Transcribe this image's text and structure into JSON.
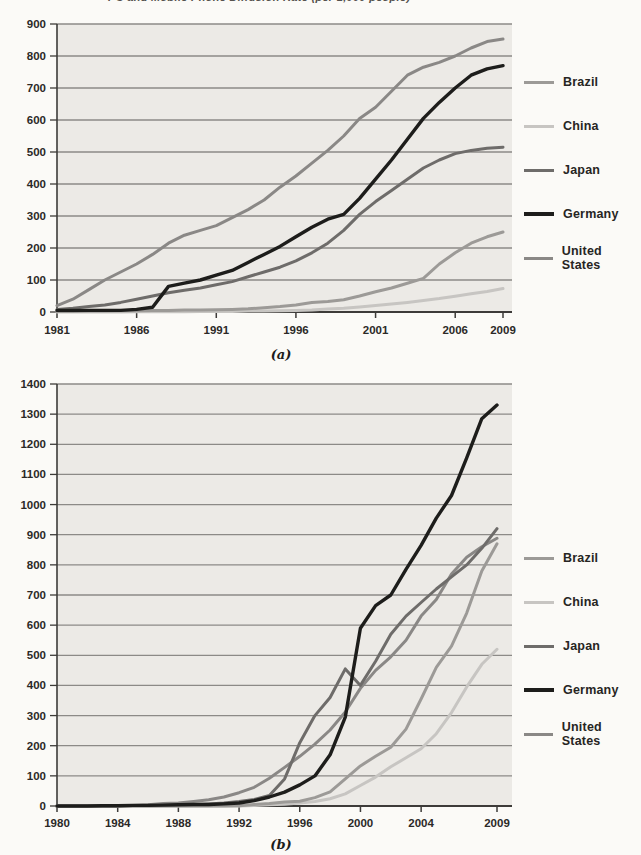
{
  "page": {
    "title_fragment": "PC and Mobile Phone Diffusion Rate (per 1,000 people)",
    "caption_a": "(a)",
    "caption_b": "(b)"
  },
  "colors": {
    "page_bg": "#fbfaf7",
    "plot_bg": "#eceae6",
    "gridline": "#8c8a87",
    "axis": "#3d3b39",
    "text": "#2b2927",
    "brazil": "#9c9a97",
    "china": "#c7c5c2",
    "japan": "#6e6c6a",
    "germany": "#1d1d1b",
    "united_states": "#8a8886"
  },
  "chart_data": [
    {
      "id": "a",
      "type": "line",
      "title": "",
      "xlabel": "",
      "ylabel": "",
      "ylim": [
        0,
        900
      ],
      "ytick_step": 100,
      "xlim": [
        1981,
        2009
      ],
      "xticks": [
        1981,
        1986,
        1991,
        1996,
        2001,
        2006,
        2009
      ],
      "grid": true,
      "legend_position": "right",
      "x": [
        1981,
        1982,
        1983,
        1984,
        1985,
        1986,
        1987,
        1988,
        1989,
        1990,
        1991,
        1992,
        1993,
        1994,
        1995,
        1996,
        1997,
        1998,
        1999,
        2000,
        2001,
        2002,
        2003,
        2004,
        2005,
        2006,
        2007,
        2008,
        2009
      ],
      "series": [
        {
          "name": "Brazil",
          "key": "brazil",
          "z": 4,
          "width": 3,
          "values": [
            2,
            2,
            3,
            3,
            4,
            4,
            5,
            5,
            6,
            6,
            7,
            8,
            10,
            13,
            17,
            22,
            30,
            33,
            38,
            50,
            63,
            75,
            90,
            105,
            150,
            185,
            215,
            235,
            250
          ]
        },
        {
          "name": "China",
          "key": "china",
          "z": 3,
          "width": 3,
          "values": [
            0,
            0,
            0,
            0,
            0,
            1,
            1,
            1,
            1,
            2,
            2,
            2,
            3,
            3,
            4,
            5,
            6,
            9,
            12,
            16,
            20,
            25,
            30,
            36,
            42,
            49,
            57,
            64,
            73
          ]
        },
        {
          "name": "Japan",
          "key": "japan",
          "z": 2,
          "width": 3,
          "values": [
            8,
            12,
            17,
            22,
            30,
            40,
            50,
            60,
            68,
            75,
            85,
            95,
            110,
            125,
            140,
            160,
            185,
            215,
            255,
            305,
            345,
            380,
            415,
            450,
            475,
            495,
            505,
            512,
            515
          ]
        },
        {
          "name": "Germany",
          "key": "germany",
          "z": 5,
          "width": 3.4,
          "values": [
            5,
            5,
            5,
            5,
            5,
            8,
            15,
            80,
            90,
            100,
            115,
            130,
            155,
            180,
            205,
            235,
            265,
            290,
            305,
            355,
            415,
            475,
            540,
            605,
            655,
            700,
            740,
            760,
            770
          ]
        },
        {
          "name": "United States",
          "key": "united_states",
          "z": 1,
          "width": 3,
          "values": [
            20,
            40,
            70,
            100,
            125,
            150,
            180,
            215,
            240,
            255,
            270,
            295,
            320,
            350,
            390,
            425,
            465,
            505,
            550,
            605,
            640,
            690,
            740,
            765,
            780,
            800,
            825,
            845,
            853
          ]
        }
      ],
      "layout": {
        "left": 57,
        "xright": 503,
        "grid_right": 512,
        "top": 16,
        "bottom": 304,
        "label_y": 326,
        "tick_len": 6
      }
    },
    {
      "id": "b",
      "type": "line",
      "title": "",
      "xlabel": "",
      "ylabel": "",
      "ylim": [
        0,
        1400
      ],
      "ytick_step": 100,
      "xlim": [
        1980,
        2009
      ],
      "xticks": [
        1980,
        1984,
        1988,
        1992,
        1996,
        2000,
        2004,
        2009
      ],
      "grid": true,
      "legend_position": "right",
      "x": [
        1980,
        1981,
        1982,
        1983,
        1984,
        1985,
        1986,
        1987,
        1988,
        1989,
        1990,
        1991,
        1992,
        1993,
        1994,
        1995,
        1996,
        1997,
        1998,
        1999,
        2000,
        2001,
        2002,
        2003,
        2004,
        2005,
        2006,
        2007,
        2008,
        2009
      ],
      "series": [
        {
          "name": "Brazil",
          "key": "brazil",
          "z": 4,
          "width": 3,
          "values": [
            0,
            0,
            0,
            0,
            0,
            0,
            0,
            0,
            0,
            0,
            0,
            0,
            1,
            5,
            8,
            13,
            16,
            28,
            47,
            90,
            133,
            165,
            195,
            255,
            355,
            460,
            530,
            640,
            780,
            870
          ]
        },
        {
          "name": "China",
          "key": "china",
          "z": 3,
          "width": 3,
          "values": [
            0,
            0,
            0,
            0,
            0,
            0,
            0,
            0,
            0,
            0,
            0,
            0,
            0,
            2,
            4,
            6,
            10,
            15,
            24,
            40,
            68,
            96,
            130,
            160,
            190,
            240,
            310,
            395,
            470,
            520
          ]
        },
        {
          "name": "Japan",
          "key": "japan",
          "z": 2,
          "width": 3,
          "values": [
            0,
            0,
            0,
            0,
            0,
            1,
            1,
            2,
            3,
            5,
            7,
            10,
            15,
            22,
            35,
            90,
            210,
            300,
            360,
            455,
            400,
            480,
            570,
            630,
            675,
            720,
            760,
            800,
            855,
            920
          ]
        },
        {
          "name": "Germany",
          "key": "germany",
          "z": 5,
          "width": 3.4,
          "values": [
            0,
            0,
            0,
            1,
            1,
            2,
            2,
            3,
            4,
            5,
            5,
            7,
            10,
            18,
            30,
            46,
            70,
            100,
            170,
            295,
            590,
            665,
            700,
            785,
            865,
            955,
            1030,
            1155,
            1285,
            1330
          ]
        },
        {
          "name": "United States",
          "key": "united_states",
          "z": 1,
          "width": 3,
          "values": [
            0,
            0,
            0,
            0,
            1,
            2,
            4,
            8,
            10,
            15,
            21,
            30,
            44,
            62,
            92,
            128,
            165,
            205,
            252,
            312,
            390,
            450,
            495,
            550,
            630,
            685,
            770,
            825,
            860,
            888
          ]
        }
      ],
      "layout": {
        "left": 57,
        "xright": 497,
        "grid_right": 512,
        "top": 16,
        "bottom": 438,
        "label_y": 459,
        "tick_len": 6
      }
    }
  ]
}
